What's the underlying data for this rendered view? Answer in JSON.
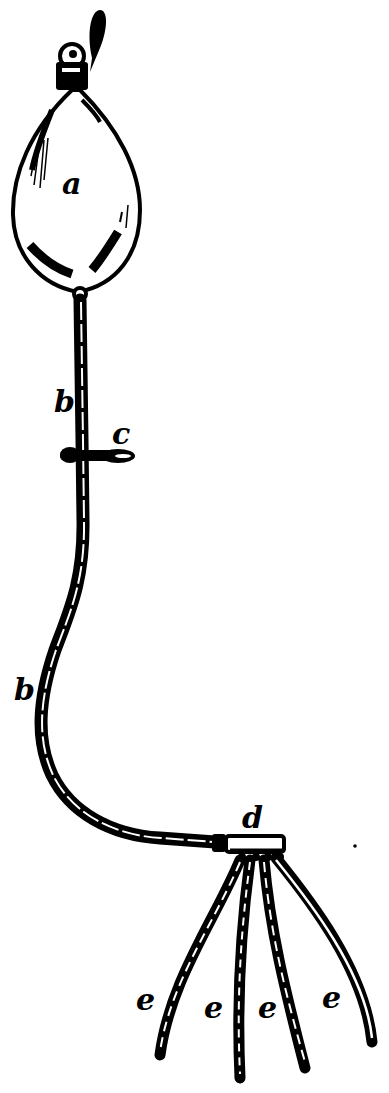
{
  "figure": {
    "ink_color": "#000000",
    "background_color": "#ffffff"
  },
  "labels": {
    "bulb": "a",
    "tube_upper": "b",
    "tube_lower": "b",
    "clamp": "c",
    "manifold": "d",
    "nozzle_1": "e",
    "nozzle_2": "e",
    "nozzle_3": "e",
    "nozzle_4": "e"
  },
  "parts": [
    {
      "label": "a",
      "name": "rubber bulb"
    },
    {
      "label": "b",
      "name": "tube"
    },
    {
      "label": "c",
      "name": "clamp"
    },
    {
      "label": "d",
      "name": "manifold / distributor"
    },
    {
      "label": "e",
      "name": "branch nozzles (4)"
    }
  ]
}
